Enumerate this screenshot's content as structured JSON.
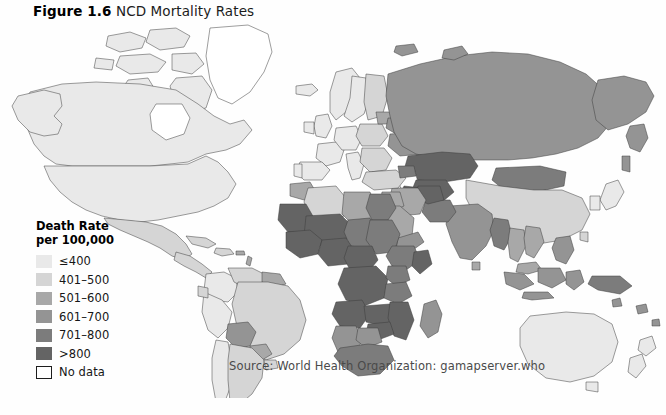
{
  "figure": {
    "label": "Figure 1.6",
    "name": "NCD Mortality Rates",
    "source": "Source:  World Health Organization: gamapserver.who"
  },
  "legend": {
    "title_line1": "Death Rate",
    "title_line2": "per 100,000",
    "items": [
      {
        "label": "≤400",
        "color": "#e9e9e9",
        "bordered": false
      },
      {
        "label": "401–500",
        "color": "#d5d5d5",
        "bordered": false
      },
      {
        "label": "501–600",
        "color": "#a8a8a8",
        "bordered": false
      },
      {
        "label": "601–700",
        "color": "#949494",
        "bordered": false
      },
      {
        "label": "701–800",
        "color": "#7c7c7c",
        "bordered": false
      },
      {
        "label": ">800",
        "color": "#646464",
        "bordered": false
      },
      {
        "label": "No data",
        "color": "#ffffff",
        "bordered": true
      }
    ]
  },
  "chart_data": {
    "type": "map",
    "map_type": "choropleth",
    "title": "NCD Mortality Rates",
    "value_label": "Death Rate per 100,000",
    "projection": "world",
    "grid": false,
    "legend_position": "left",
    "bins": [
      {
        "label": "≤400",
        "min": 0,
        "max": 400,
        "color": "#e9e9e9"
      },
      {
        "label": "401–500",
        "min": 401,
        "max": 500,
        "color": "#d5d5d5"
      },
      {
        "label": "501–600",
        "min": 501,
        "max": 600,
        "color": "#a8a8a8"
      },
      {
        "label": "601–700",
        "min": 601,
        "max": 700,
        "color": "#949494"
      },
      {
        "label": "701–800",
        "min": 701,
        "max": 800,
        "color": "#7c7c7c"
      },
      {
        "label": ">800",
        "min": 801,
        "max": null,
        "color": "#646464"
      },
      {
        "label": "No data",
        "min": null,
        "max": null,
        "color": "#ffffff"
      }
    ],
    "regions": [
      {
        "name": "Canada",
        "bin": "≤400"
      },
      {
        "name": "United States",
        "bin": "≤400"
      },
      {
        "name": "Alaska",
        "bin": "≤400"
      },
      {
        "name": "Greenland",
        "bin": "No data"
      },
      {
        "name": "Mexico",
        "bin": "401–500"
      },
      {
        "name": "Central America",
        "bin": "401–500"
      },
      {
        "name": "Caribbean",
        "bin": "401–500"
      },
      {
        "name": "Colombia",
        "bin": "≤400"
      },
      {
        "name": "Venezuela",
        "bin": "401–500"
      },
      {
        "name": "Guyanas",
        "bin": "501–600"
      },
      {
        "name": "Brazil",
        "bin": "401–500"
      },
      {
        "name": "Peru",
        "bin": "≤400"
      },
      {
        "name": "Bolivia",
        "bin": "601–700"
      },
      {
        "name": "Paraguay",
        "bin": "501–600"
      },
      {
        "name": "Chile",
        "bin": "≤400"
      },
      {
        "name": "Argentina",
        "bin": "401–500"
      },
      {
        "name": "Uruguay",
        "bin": "401–500"
      },
      {
        "name": "Iceland",
        "bin": "≤400"
      },
      {
        "name": "Norway",
        "bin": "≤400"
      },
      {
        "name": "Sweden",
        "bin": "≤400"
      },
      {
        "name": "Finland",
        "bin": "401–500"
      },
      {
        "name": "United Kingdom",
        "bin": "≤400"
      },
      {
        "name": "Ireland",
        "bin": "≤400"
      },
      {
        "name": "France",
        "bin": "≤400"
      },
      {
        "name": "Spain",
        "bin": "≤400"
      },
      {
        "name": "Portugal",
        "bin": "≤400"
      },
      {
        "name": "Germany",
        "bin": "≤400"
      },
      {
        "name": "Poland",
        "bin": "401–500"
      },
      {
        "name": "Italy",
        "bin": "≤400"
      },
      {
        "name": "Balkans",
        "bin": "401–500"
      },
      {
        "name": "Greece",
        "bin": "≤400"
      },
      {
        "name": "Ukraine",
        "bin": "601–700"
      },
      {
        "name": "Belarus",
        "bin": "601–700"
      },
      {
        "name": "Baltics",
        "bin": "501–600"
      },
      {
        "name": "Russia",
        "bin": "601–700"
      },
      {
        "name": "Turkey",
        "bin": "401–500"
      },
      {
        "name": "Kazakhstan",
        "bin": ">800"
      },
      {
        "name": "Uzbekistan",
        "bin": ">800"
      },
      {
        "name": "Turkmenistan",
        "bin": ">800"
      },
      {
        "name": "Mongolia",
        "bin": "701–800"
      },
      {
        "name": "China",
        "bin": "401–500"
      },
      {
        "name": "Japan",
        "bin": "≤400"
      },
      {
        "name": "Korea",
        "bin": "≤400"
      },
      {
        "name": "India",
        "bin": "601–700"
      },
      {
        "name": "Pakistan",
        "bin": "701–800"
      },
      {
        "name": "Afghanistan",
        "bin": ">800"
      },
      {
        "name": "Iran",
        "bin": "501–600"
      },
      {
        "name": "Iraq",
        "bin": "501–600"
      },
      {
        "name": "Saudi Arabia",
        "bin": "501–600"
      },
      {
        "name": "Arabian Peninsula",
        "bin": "601–700"
      },
      {
        "name": "Egypt",
        "bin": "701–800"
      },
      {
        "name": "Libya",
        "bin": "501–600"
      },
      {
        "name": "Algeria",
        "bin": "401–500"
      },
      {
        "name": "Morocco",
        "bin": "501–600"
      },
      {
        "name": "Sahel",
        "bin": ">800"
      },
      {
        "name": "West Africa",
        "bin": ">800"
      },
      {
        "name": "Nigeria",
        "bin": ">800"
      },
      {
        "name": "Sudan",
        "bin": "701–800"
      },
      {
        "name": "Ethiopia",
        "bin": "701–800"
      },
      {
        "name": "Central Africa",
        "bin": ">800"
      },
      {
        "name": "East Africa",
        "bin": ">800"
      },
      {
        "name": "Kenya",
        "bin": "701–800"
      },
      {
        "name": "Tanzania",
        "bin": "701–800"
      },
      {
        "name": "Angola",
        "bin": ">800"
      },
      {
        "name": "Zambia",
        "bin": ">800"
      },
      {
        "name": "Mozambique",
        "bin": ">800"
      },
      {
        "name": "Zimbabwe",
        "bin": ">800"
      },
      {
        "name": "Botswana",
        "bin": "601–700"
      },
      {
        "name": "South Africa",
        "bin": "701–800"
      },
      {
        "name": "Namibia",
        "bin": "601–700"
      },
      {
        "name": "Madagascar",
        "bin": "601–700"
      },
      {
        "name": "Myanmar",
        "bin": "701–800"
      },
      {
        "name": "Thailand",
        "bin": "501–600"
      },
      {
        "name": "Vietnam",
        "bin": "501–600"
      },
      {
        "name": "Indonesia",
        "bin": "601–700"
      },
      {
        "name": "Malaysia",
        "bin": "501–600"
      },
      {
        "name": "Philippines",
        "bin": "601–700"
      },
      {
        "name": "Papua New Guinea",
        "bin": "701–800"
      },
      {
        "name": "Australia",
        "bin": "≤400"
      },
      {
        "name": "New Zealand",
        "bin": "≤400"
      }
    ]
  }
}
